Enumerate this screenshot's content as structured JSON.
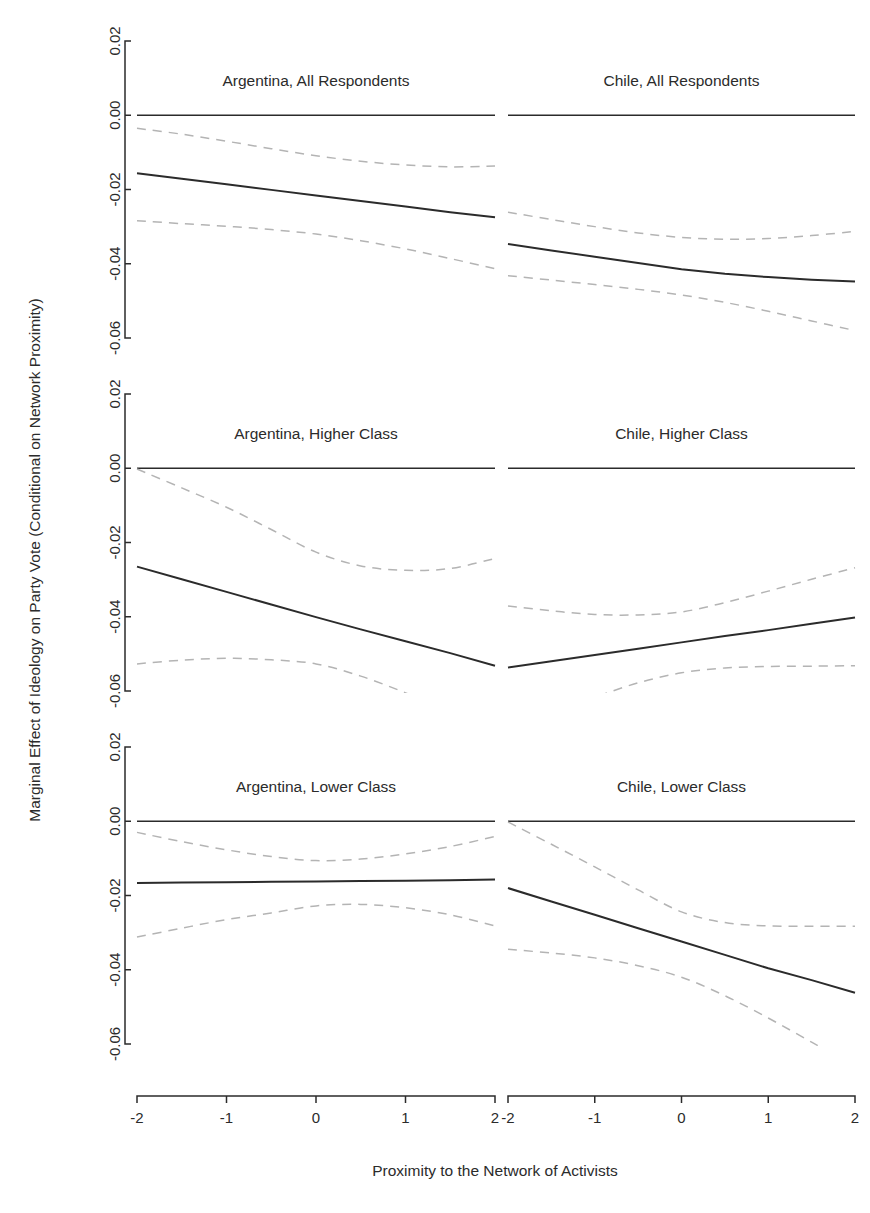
{
  "figure": {
    "y_axis_title": "Marginal Effect of Ideology on Party Vote (Conditional on Network Proximity)",
    "x_axis_title": "Proximity to the Network of Activists",
    "background_color": "#ffffff",
    "line_color": "#2b2b2b",
    "ci_color": "#b4b4b4"
  },
  "chart_data": {
    "type": "line",
    "title": "",
    "xlabel": "Proximity to the Network of Activists",
    "ylabel": "Marginal Effect of Ideology on Party Vote (Conditional on Network Proximity)",
    "xlim": [
      -2,
      2
    ],
    "ylim": [
      -0.06,
      0.02
    ],
    "grid": false,
    "legend": "none",
    "xticks": [
      -2,
      -1,
      0,
      1,
      2
    ],
    "xtick_labels": [
      "-2",
      "-1",
      "0",
      "1",
      "2"
    ],
    "yticks": [
      0.02,
      0.0,
      -0.02,
      -0.04,
      -0.06
    ],
    "ytick_labels": [
      "0.02",
      "0.00",
      "-0.02",
      "-0.04",
      "-0.06"
    ],
    "layout": "2 columns x 3 rows of panels",
    "reference_line_y": 0.0,
    "panels": [
      {
        "title": "Argentina, All Respondents",
        "row": 0,
        "col": 0,
        "x": [
          -2,
          -1.5,
          -1,
          -0.5,
          0,
          0.5,
          1,
          1.5,
          2
        ],
        "series": [
          {
            "name": "Marginal effect",
            "style": "solid",
            "values": [
              -0.0156,
              -0.0171,
              -0.0186,
              -0.0201,
              -0.0216,
              -0.0231,
              -0.0246,
              -0.0261,
              -0.0275
            ]
          },
          {
            "name": "Upper 95% CI",
            "style": "dashed",
            "values": [
              -0.0035,
              -0.0051,
              -0.007,
              -0.009,
              -0.0109,
              -0.0124,
              -0.0134,
              -0.0139,
              -0.0137
            ]
          },
          {
            "name": "Lower 95% CI",
            "style": "dashed",
            "values": [
              -0.0284,
              -0.0292,
              -0.0299,
              -0.0308,
              -0.032,
              -0.0338,
              -0.036,
              -0.0386,
              -0.0413
            ]
          }
        ]
      },
      {
        "title": "Chile, All Respondents",
        "row": 0,
        "col": 1,
        "x": [
          -2,
          -1.5,
          -1,
          -0.5,
          0,
          0.5,
          1,
          1.5,
          2
        ],
        "series": [
          {
            "name": "Marginal effect",
            "style": "solid",
            "values": [
              -0.0347,
              -0.0364,
              -0.0381,
              -0.0398,
              -0.0415,
              -0.0427,
              -0.0436,
              -0.0443,
              -0.0448
            ]
          },
          {
            "name": "Upper 95% CI",
            "style": "dashed",
            "values": [
              -0.0261,
              -0.0281,
              -0.03,
              -0.0317,
              -0.0329,
              -0.0334,
              -0.0332,
              -0.0324,
              -0.0313
            ]
          },
          {
            "name": "Lower 95% CI",
            "style": "dashed",
            "values": [
              -0.0432,
              -0.0444,
              -0.0456,
              -0.0469,
              -0.0484,
              -0.0504,
              -0.0528,
              -0.0554,
              -0.058
            ]
          }
        ]
      },
      {
        "title": "Argentina, Higher Class",
        "row": 1,
        "col": 0,
        "x": [
          -2,
          -1.5,
          -1,
          -0.5,
          0,
          0.5,
          1,
          1.5,
          2
        ],
        "series": [
          {
            "name": "Marginal effect",
            "style": "solid",
            "values": [
              -0.0265,
              -0.0299,
              -0.0333,
              -0.0367,
              -0.0401,
              -0.0434,
              -0.0466,
              -0.0498,
              -0.0532
            ]
          },
          {
            "name": "Upper 95% CI",
            "style": "dashed",
            "values": [
              -0.0002,
              -0.0053,
              -0.0105,
              -0.0165,
              -0.0226,
              -0.0263,
              -0.0275,
              -0.027,
              -0.0243
            ]
          },
          {
            "name": "Lower 95% CI",
            "style": "dashed",
            "values": [
              -0.0527,
              -0.0517,
              -0.0512,
              -0.0516,
              -0.0527,
              -0.056,
              -0.0605,
              -0.0656,
              -0.0712
            ]
          }
        ]
      },
      {
        "title": "Chile, Higher Class",
        "row": 1,
        "col": 1,
        "x": [
          -2,
          -1.5,
          -1,
          -0.5,
          0,
          0.5,
          1,
          1.5,
          2
        ],
        "series": [
          {
            "name": "Marginal effect",
            "style": "solid",
            "values": [
              -0.0537,
              -0.052,
              -0.0503,
              -0.0486,
              -0.0469,
              -0.0452,
              -0.0436,
              -0.0419,
              -0.0402
            ]
          },
          {
            "name": "Upper 95% CI",
            "style": "dashed",
            "values": [
              -0.0371,
              -0.0384,
              -0.0394,
              -0.0395,
              -0.0387,
              -0.0362,
              -0.0331,
              -0.0299,
              -0.0268
            ]
          },
          {
            "name": "Lower 95% CI",
            "style": "dashed",
            "values": [
              -0.07,
              -0.066,
              -0.0617,
              -0.0578,
              -0.0551,
              -0.0538,
              -0.0534,
              -0.0533,
              -0.0532
            ]
          }
        ]
      },
      {
        "title": "Argentina, Lower Class",
        "row": 2,
        "col": 0,
        "x": [
          -2,
          -1.5,
          -1,
          -0.5,
          0,
          0.5,
          1,
          1.5,
          2
        ],
        "series": [
          {
            "name": "Marginal effect",
            "style": "solid",
            "values": [
              -0.0166,
              -0.0165,
              -0.0164,
              -0.0163,
              -0.0162,
              -0.0161,
              -0.016,
              -0.0159,
              -0.0157
            ]
          },
          {
            "name": "Upper 95% CI",
            "style": "dashed",
            "values": [
              -0.003,
              -0.0055,
              -0.0077,
              -0.0095,
              -0.0106,
              -0.0102,
              -0.0088,
              -0.0068,
              -0.0041
            ]
          },
          {
            "name": "Lower 95% CI",
            "style": "dashed",
            "values": [
              -0.0312,
              -0.0288,
              -0.0265,
              -0.0247,
              -0.0228,
              -0.0224,
              -0.0233,
              -0.0252,
              -0.0282
            ]
          }
        ]
      },
      {
        "title": "Chile, Lower Class",
        "row": 2,
        "col": 1,
        "x": [
          -2,
          -1.5,
          -1,
          -0.5,
          0,
          0.5,
          1,
          1.5,
          2
        ],
        "series": [
          {
            "name": "Marginal effect",
            "style": "solid",
            "values": [
              -0.018,
              -0.0216,
              -0.0252,
              -0.0288,
              -0.0324,
              -0.036,
              -0.0396,
              -0.0428,
              -0.0462
            ]
          },
          {
            "name": "Upper 95% CI",
            "style": "dashed",
            "values": [
              -0.0002,
              -0.0062,
              -0.0123,
              -0.0185,
              -0.0244,
              -0.0273,
              -0.0282,
              -0.0283,
              -0.0283
            ]
          },
          {
            "name": "Lower 95% CI",
            "style": "dashed",
            "values": [
              -0.0345,
              -0.0355,
              -0.0368,
              -0.0389,
              -0.042,
              -0.047,
              -0.053,
              -0.0595,
              -0.066
            ]
          }
        ]
      }
    ]
  }
}
